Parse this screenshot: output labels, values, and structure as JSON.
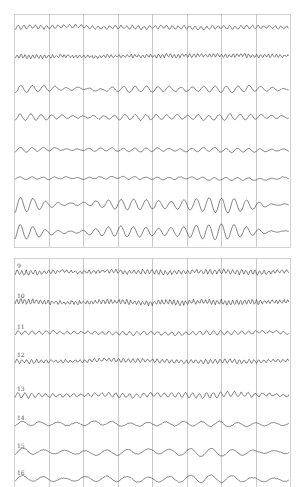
{
  "colors": {
    "background": "#ffffff",
    "grid": "#bdbdbd",
    "frame": "#c8c8c8",
    "trace": "#333333",
    "label": "#555555"
  },
  "chart_data": [
    {
      "type": "line",
      "title": "",
      "description": "Multichannel EEG-like trace panel (channels 1-8, unlabeled)",
      "xlabel": "",
      "ylabel": "",
      "grid": true,
      "columns": 8,
      "frame": {
        "x": 14,
        "y": 14,
        "width": 276,
        "height": 233
      },
      "series": [
        {
          "name": "1",
          "show_label": false,
          "baseline_y": 27,
          "amplitude": 1.6,
          "freq": 1.1,
          "noise": 1.0,
          "burst": 0.2
        },
        {
          "name": "2",
          "show_label": false,
          "baseline_y": 56,
          "amplitude": 1.5,
          "freq": 1.6,
          "noise": 1.3,
          "burst": 0.2
        },
        {
          "name": "3",
          "show_label": false,
          "baseline_y": 89,
          "amplitude": 2.4,
          "freq": 0.55,
          "noise": 0.5,
          "burst": 0.6
        },
        {
          "name": "4",
          "show_label": false,
          "baseline_y": 117,
          "amplitude": 2.2,
          "freq": 0.6,
          "noise": 0.6,
          "burst": 0.5
        },
        {
          "name": "5",
          "show_label": false,
          "baseline_y": 150,
          "amplitude": 1.6,
          "freq": 0.55,
          "noise": 0.4,
          "burst": 0.4
        },
        {
          "name": "6",
          "show_label": false,
          "baseline_y": 178,
          "amplitude": 1.1,
          "freq": 0.55,
          "noise": 0.3,
          "burst": 0.3
        },
        {
          "name": "7",
          "show_label": false,
          "baseline_y": 205,
          "amplitude": 4.5,
          "freq": 0.5,
          "noise": 0.3,
          "burst": 0.9
        },
        {
          "name": "8",
          "show_label": false,
          "baseline_y": 232,
          "amplitude": 4.5,
          "freq": 0.5,
          "noise": 0.3,
          "burst": 0.9
        }
      ]
    },
    {
      "type": "line",
      "title": "",
      "description": "Multichannel EEG-like trace panel (channels 9-16, labeled)",
      "xlabel": "",
      "ylabel": "",
      "grid": true,
      "columns": 8,
      "frame": {
        "x": 14,
        "y": 258,
        "width": 276,
        "height": 229
      },
      "series": [
        {
          "name": "9",
          "show_label": true,
          "baseline_y": 272,
          "amplitude": 1.8,
          "freq": 1.4,
          "noise": 1.5,
          "burst": 0.3
        },
        {
          "name": "10",
          "show_label": true,
          "baseline_y": 302,
          "amplitude": 2.0,
          "freq": 1.6,
          "noise": 1.8,
          "burst": 0.3
        },
        {
          "name": "11",
          "show_label": true,
          "baseline_y": 333,
          "amplitude": 1.6,
          "freq": 0.9,
          "noise": 0.7,
          "burst": 0.2
        },
        {
          "name": "12",
          "show_label": true,
          "baseline_y": 361,
          "amplitude": 1.7,
          "freq": 1.3,
          "noise": 1.1,
          "burst": 0.3
        },
        {
          "name": "13",
          "show_label": true,
          "baseline_y": 395,
          "amplitude": 2.0,
          "freq": 0.9,
          "noise": 1.0,
          "burst": 0.4
        },
        {
          "name": "14",
          "show_label": true,
          "baseline_y": 424,
          "amplitude": 2.0,
          "freq": 0.35,
          "noise": 0.5,
          "burst": 0.3
        },
        {
          "name": "15",
          "show_label": true,
          "baseline_y": 452,
          "amplitude": 2.8,
          "freq": 0.3,
          "noise": 0.5,
          "burst": 0.5
        },
        {
          "name": "16",
          "show_label": true,
          "baseline_y": 479,
          "amplitude": 2.8,
          "freq": 0.3,
          "noise": 0.5,
          "burst": 0.5
        }
      ]
    }
  ]
}
